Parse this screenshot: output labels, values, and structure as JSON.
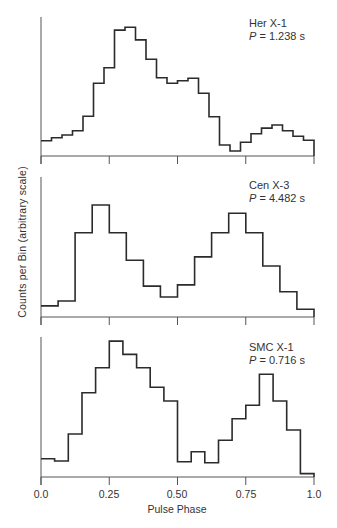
{
  "chart_data": [
    {
      "type": "bar",
      "style": "step-histogram",
      "title": "Her X-1",
      "period_label": "P = 1.238 s",
      "source": "Her X-1",
      "period": "1.238 s",
      "xlabel": "Pulse Phase",
      "ylabel": "Counts per Bin (arbitrary scale)",
      "xlim": [
        0.0,
        1.0
      ],
      "ylim": [
        0,
        100
      ],
      "bins": 26,
      "values": [
        11.0,
        13.2,
        15.1,
        18.2,
        28.6,
        52.3,
        63.5,
        90.6,
        92.6,
        83.5,
        69.6,
        56.3,
        52.3,
        54.2,
        55.9,
        45.1,
        28.3,
        7.9,
        3.6,
        9.9,
        16.0,
        20.1,
        22.3,
        18.2,
        14.2,
        11.3
      ]
    },
    {
      "type": "bar",
      "style": "step-histogram",
      "title": "Cen X-3",
      "period_label": "P = 4.482 s",
      "source": "Cen X-3",
      "period": "4.482 s",
      "xlabel": "Pulse Phase",
      "ylabel": "Counts per Bin (arbitrary scale)",
      "xlim": [
        0.0,
        1.0
      ],
      "ylim": [
        0,
        100
      ],
      "bins": 16,
      "values": [
        7.9,
        11.4,
        60.2,
        80.0,
        60.2,
        40.5,
        22.1,
        14.3,
        22.9,
        42.9,
        60.2,
        74.1,
        60.2,
        36.4,
        18.1,
        5.5
      ]
    },
    {
      "type": "bar",
      "style": "step-histogram",
      "title": "SMC X-1",
      "period_label": "P = 0.716 s",
      "source": "SMC X-1",
      "period": "0.716 s",
      "xlabel": "Pulse Phase",
      "ylabel": "Counts per Bin (arbitrary scale)",
      "xlim": [
        0.0,
        1.0
      ],
      "ylim": [
        0,
        100
      ],
      "bins": 20,
      "values": [
        13.1,
        11.4,
        30.7,
        60.2,
        78.1,
        97.1,
        87.6,
        78.1,
        64.1,
        54.3,
        10.9,
        18.1,
        10.2,
        26.2,
        41.6,
        51.2,
        73.4,
        54.3,
        33.6,
        2.4
      ]
    }
  ],
  "axes": {
    "xlabel": "Pulse Phase",
    "ylabel": "Counts per Bin (arbitrary scale)",
    "xticks": [
      "0.0",
      "0.25",
      "0.50",
      "0.75",
      "1.0"
    ],
    "grid": false
  },
  "panels": [
    {
      "name": "Her X-1",
      "p_symbol": "P",
      "p_value": "= 1.238 s"
    },
    {
      "name": "Cen X-3",
      "p_symbol": "P",
      "p_value": "= 4.482 s"
    },
    {
      "name": "SMC X-1",
      "p_symbol": "P",
      "p_value": "= 0.716 s"
    }
  ],
  "colors": {
    "line": "#2b2b2b",
    "axis": "#555555",
    "background": "#ffffff"
  }
}
